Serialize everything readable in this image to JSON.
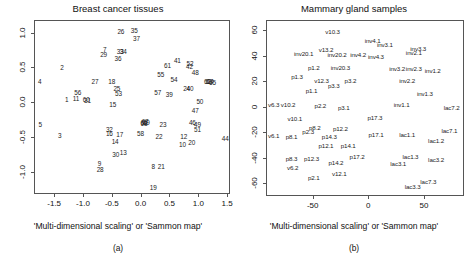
{
  "figure": {
    "width": 472,
    "height": 262,
    "background": "#ffffff",
    "text_color": "#1a1a1a",
    "axis_color": "#555555"
  },
  "panels": [
    {
      "id": "a",
      "subcaption": "(a)",
      "axis_caption": "'Multi-dimensional scaling' or 'Sammon map'",
      "chart_data": {
        "type": "scatter",
        "title": "Breast cancer tissues",
        "xlabel": "'Multi-dimensional scaling' or 'Sammon map'",
        "ylabel": "",
        "xlim": [
          -1.85,
          1.55
        ],
        "ylim": [
          -1.32,
          1.18
        ],
        "xticks": [
          -1.5,
          -1.0,
          -0.5,
          0.0,
          0.5,
          1.0,
          1.5
        ],
        "xticklabels": [
          "-1.5",
          "-1.0",
          "-0.5",
          "0.0",
          "0.5",
          "1.0",
          "1.5"
        ],
        "yticks": [
          1.0,
          0.5,
          0.0,
          -0.5,
          -1.0
        ],
        "yticklabels": [
          "1.0",
          "0.5",
          "0.0",
          "-0.5",
          "-1.0"
        ],
        "grid": false,
        "legend": "none",
        "marker": "text-label",
        "points": [
          {
            "label": "26",
            "x": -0.36,
            "y": 1.02
          },
          {
            "label": "35",
            "x": -0.13,
            "y": 1.04
          },
          {
            "label": "37",
            "x": -0.09,
            "y": 0.92
          },
          {
            "label": "7",
            "x": -0.64,
            "y": 0.76
          },
          {
            "label": "33",
            "x": -0.37,
            "y": 0.73
          },
          {
            "label": "34",
            "x": -0.32,
            "y": 0.73
          },
          {
            "label": "29",
            "x": -0.66,
            "y": 0.69
          },
          {
            "label": "36",
            "x": -0.41,
            "y": 0.63
          },
          {
            "label": "41",
            "x": 0.62,
            "y": 0.6
          },
          {
            "label": "52",
            "x": 0.84,
            "y": 0.56
          },
          {
            "label": "61",
            "x": 0.45,
            "y": 0.53
          },
          {
            "label": "42",
            "x": 0.83,
            "y": 0.52
          },
          {
            "label": "2",
            "x": -1.38,
            "y": 0.5
          },
          {
            "label": "48",
            "x": 0.93,
            "y": 0.43
          },
          {
            "label": "55",
            "x": 0.33,
            "y": 0.4
          },
          {
            "label": "54",
            "x": 0.56,
            "y": 0.33
          },
          {
            "label": "4",
            "x": -1.77,
            "y": 0.3
          },
          {
            "label": "27",
            "x": -0.81,
            "y": 0.3
          },
          {
            "label": "18",
            "x": -0.52,
            "y": 0.3
          },
          {
            "label": "62",
            "x": 1.14,
            "y": 0.3
          },
          {
            "label": "63",
            "x": 1.17,
            "y": 0.31
          },
          {
            "label": "64",
            "x": 1.19,
            "y": 0.3
          },
          {
            "label": "65",
            "x": 1.23,
            "y": 0.29
          },
          {
            "label": "25",
            "x": -0.43,
            "y": 0.2
          },
          {
            "label": "24",
            "x": 0.78,
            "y": 0.21
          },
          {
            "label": "40",
            "x": 0.84,
            "y": 0.21
          },
          {
            "label": "56",
            "x": -1.11,
            "y": 0.14
          },
          {
            "label": "53",
            "x": -0.4,
            "y": 0.13
          },
          {
            "label": "57",
            "x": 0.28,
            "y": 0.15
          },
          {
            "label": "39",
            "x": 0.48,
            "y": 0.12
          },
          {
            "label": "1",
            "x": -1.3,
            "y": 0.04
          },
          {
            "label": "11",
            "x": -1.14,
            "y": 0.06
          },
          {
            "label": "31",
            "x": -0.94,
            "y": 0.03
          },
          {
            "label": "60",
            "x": -0.96,
            "y": 0.04
          },
          {
            "label": "50",
            "x": 1.01,
            "y": 0.02
          },
          {
            "label": "15",
            "x": -0.5,
            "y": -0.03
          },
          {
            "label": "47",
            "x": 0.93,
            "y": -0.12
          },
          {
            "label": "5",
            "x": -1.76,
            "y": -0.31
          },
          {
            "label": "46",
            "x": 0.88,
            "y": -0.28
          },
          {
            "label": "49",
            "x": 0.97,
            "y": -0.32
          },
          {
            "label": "23",
            "x": 0.37,
            "y": -0.31
          },
          {
            "label": "66",
            "x": 0.04,
            "y": -0.28
          },
          {
            "label": "67",
            "x": 0.06,
            "y": -0.27
          },
          {
            "label": "68",
            "x": 0.04,
            "y": -0.3
          },
          {
            "label": "69",
            "x": 0.08,
            "y": -0.28
          },
          {
            "label": "51",
            "x": 0.97,
            "y": -0.38
          },
          {
            "label": "32",
            "x": -0.56,
            "y": -0.39
          },
          {
            "label": "16",
            "x": -0.56,
            "y": -0.44
          },
          {
            "label": "3",
            "x": -1.42,
            "y": -0.47
          },
          {
            "label": "58",
            "x": -0.02,
            "y": -0.45
          },
          {
            "label": "17",
            "x": -0.38,
            "y": -0.46
          },
          {
            "label": "22",
            "x": 0.3,
            "y": -0.48
          },
          {
            "label": "12",
            "x": 0.73,
            "y": -0.49
          },
          {
            "label": "44",
            "x": 1.45,
            "y": -0.52
          },
          {
            "label": "20",
            "x": 0.87,
            "y": -0.57
          },
          {
            "label": "14",
            "x": -0.46,
            "y": -0.56
          },
          {
            "label": "10",
            "x": 0.71,
            "y": -0.6
          },
          {
            "label": "13",
            "x": -0.32,
            "y": -0.71
          },
          {
            "label": "30",
            "x": -0.45,
            "y": -0.74
          },
          {
            "label": "9",
            "x": -0.73,
            "y": -0.88
          },
          {
            "label": "8",
            "x": 0.2,
            "y": -0.92
          },
          {
            "label": "21",
            "x": 0.34,
            "y": -0.92
          },
          {
            "label": "28",
            "x": -0.72,
            "y": -0.96
          },
          {
            "label": "19",
            "x": 0.2,
            "y": -1.22
          }
        ]
      }
    },
    {
      "id": "b",
      "subcaption": "(b)",
      "axis_caption": "'Multi-dimensional scaling' or 'Sammon map'",
      "chart_data": {
        "type": "scatter",
        "title": "Mammary gland samples",
        "xlabel": "'Multi-dimensional scaling' or 'Sammon map'",
        "ylabel": "",
        "xlim": [
          -92,
          86
        ],
        "ylim": [
          -70,
          68
        ],
        "xticks": [
          -50,
          0,
          50
        ],
        "xticklabels": [
          "-50",
          "0",
          "50"
        ],
        "yticks": [
          60,
          40,
          20,
          0,
          -20,
          -40,
          -60
        ],
        "yticklabels": [
          "60",
          "40",
          "20",
          "0",
          "-20",
          "-40",
          "-60"
        ],
        "grid": false,
        "legend": "none",
        "marker": "text-label",
        "points": [
          {
            "label": "v10.3",
            "x": -33,
            "y": 59
          },
          {
            "label": "inv4.1",
            "x": 3,
            "y": 52
          },
          {
            "label": "inv3.1",
            "x": 14,
            "y": 49
          },
          {
            "label": "inv3.3",
            "x": 44,
            "y": 46
          },
          {
            "label": "v13.2",
            "x": -39,
            "y": 45
          },
          {
            "label": "inv2.1",
            "x": 40,
            "y": 43
          },
          {
            "label": "inv20.1",
            "x": -59,
            "y": 42
          },
          {
            "label": "inv20.2",
            "x": -29,
            "y": 41
          },
          {
            "label": "inv4.2",
            "x": -10,
            "y": 41
          },
          {
            "label": "inv4.3",
            "x": 6,
            "y": 40
          },
          {
            "label": "p1.2",
            "x": -50,
            "y": 31
          },
          {
            "label": "inv20.3",
            "x": -26,
            "y": 31
          },
          {
            "label": "inv3.2",
            "x": 25,
            "y": 30
          },
          {
            "label": "inv2.3",
            "x": 40,
            "y": 30
          },
          {
            "label": "inv1.2",
            "x": 57,
            "y": 29
          },
          {
            "label": "p1.3",
            "x": -65,
            "y": 24
          },
          {
            "label": "v12.3",
            "x": -43,
            "y": 21
          },
          {
            "label": "p3.2",
            "x": -17,
            "y": 21
          },
          {
            "label": "inv2.2",
            "x": 34,
            "y": 21
          },
          {
            "label": "p3.3",
            "x": -32,
            "y": 17
          },
          {
            "label": "p1.1",
            "x": -52,
            "y": 13
          },
          {
            "label": "inv1.3",
            "x": 50,
            "y": 11
          },
          {
            "label": "v6.3",
            "x": -86,
            "y": 2
          },
          {
            "label": "v10.2",
            "x": -73,
            "y": 2
          },
          {
            "label": "p2.2",
            "x": -44,
            "y": 1
          },
          {
            "label": "p3.1",
            "x": -23,
            "y": 0
          },
          {
            "label": "inv1.1",
            "x": 29,
            "y": 2
          },
          {
            "label": "lac7.2",
            "x": 74,
            "y": 0
          },
          {
            "label": "v10.1",
            "x": -67,
            "y": -9
          },
          {
            "label": "p17.3",
            "x": 5,
            "y": -8
          },
          {
            "label": "p8.2",
            "x": -49,
            "y": -16
          },
          {
            "label": "p12.2",
            "x": -26,
            "y": -17
          },
          {
            "label": "lac7.1",
            "x": 72,
            "y": -18
          },
          {
            "label": "p2.3",
            "x": -55,
            "y": -19
          },
          {
            "label": "p17.1",
            "x": 6,
            "y": -21
          },
          {
            "label": "lac1.1",
            "x": 34,
            "y": -21
          },
          {
            "label": "v6.1",
            "x": -86,
            "y": -22
          },
          {
            "label": "p8.1",
            "x": -70,
            "y": -23
          },
          {
            "label": "p14.3",
            "x": -36,
            "y": -23
          },
          {
            "label": "lac1.2",
            "x": 60,
            "y": -26
          },
          {
            "label": "p12.1",
            "x": -39,
            "y": -30
          },
          {
            "label": "p14.1",
            "x": -19,
            "y": -30
          },
          {
            "label": "p8.3",
            "x": -70,
            "y": -40
          },
          {
            "label": "p12.3",
            "x": -52,
            "y": -40
          },
          {
            "label": "p17.2",
            "x": -11,
            "y": -39
          },
          {
            "label": "lac1.3",
            "x": 37,
            "y": -39
          },
          {
            "label": "lac3.2",
            "x": 60,
            "y": -41
          },
          {
            "label": "p14.2",
            "x": -30,
            "y": -43
          },
          {
            "label": "lac3.1",
            "x": 26,
            "y": -44
          },
          {
            "label": "v6.2",
            "x": -69,
            "y": -47
          },
          {
            "label": "v12.1",
            "x": -27,
            "y": -52
          },
          {
            "label": "p2.1",
            "x": -50,
            "y": -55
          },
          {
            "label": "lac7.3",
            "x": 53,
            "y": -58
          },
          {
            "label": "lac3.3",
            "x": 39,
            "y": -62
          }
        ]
      }
    }
  ]
}
